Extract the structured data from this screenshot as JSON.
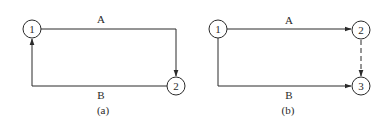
{
  "diagrams": [
    {
      "id": "a",
      "caption": "(a)",
      "nodes": [
        {
          "label": "1",
          "cx": 32,
          "cy": 29
        },
        {
          "label": "2",
          "cx": 176,
          "cy": 86
        }
      ],
      "edges": [
        {
          "label": "A",
          "from": "1",
          "to": "2",
          "style": "solid",
          "route": "top-right-down"
        },
        {
          "label": "B",
          "from": "2",
          "to": "1",
          "style": "solid",
          "route": "bottom-left-up"
        }
      ]
    },
    {
      "id": "b",
      "caption": "(b)",
      "nodes": [
        {
          "label": "1",
          "cx": 218,
          "cy": 29
        },
        {
          "label": "2",
          "cx": 361,
          "cy": 30
        },
        {
          "label": "3",
          "cx": 361,
          "cy": 86
        }
      ],
      "edges": [
        {
          "label": "A",
          "from": "1",
          "to": "2",
          "style": "solid"
        },
        {
          "label": "B",
          "from": "1",
          "to": "3",
          "style": "solid"
        },
        {
          "label": "",
          "from": "2",
          "to": "3",
          "style": "dashed"
        }
      ]
    }
  ],
  "labels": {
    "a_node1": "1",
    "a_node2": "2",
    "a_edgeA": "A",
    "a_edgeB": "B",
    "a_caption": "(a)",
    "b_node1": "1",
    "b_node2": "2",
    "b_node3": "3",
    "b_edgeA": "A",
    "b_edgeB": "B",
    "b_caption": "(b)"
  },
  "colors": {
    "line": "#2a2a2a",
    "background": "#ffffff"
  }
}
